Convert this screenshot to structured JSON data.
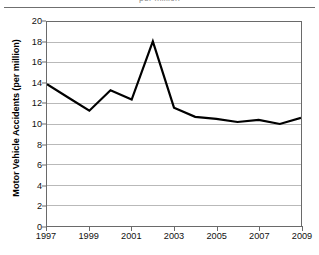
{
  "caption": {
    "clipped_text": "per million"
  },
  "chart_data": {
    "type": "line",
    "title": "",
    "xlabel": "",
    "ylabel": "Motor Vehicle Accidents (per million)",
    "x": [
      1997,
      1998,
      1999,
      2000,
      2001,
      2002,
      2003,
      2004,
      2005,
      2006,
      2007,
      2008,
      2009
    ],
    "values": [
      13.9,
      12.6,
      11.3,
      13.3,
      12.4,
      18.1,
      11.6,
      10.7,
      10.5,
      10.2,
      10.4,
      10.0,
      10.6
    ],
    "series": [
      {
        "name": "Motor Vehicle Accidents",
        "values": [
          13.9,
          12.6,
          11.3,
          13.3,
          12.4,
          18.1,
          11.6,
          10.7,
          10.5,
          10.2,
          10.4,
          10.0,
          10.6
        ]
      }
    ],
    "xlim": [
      1997,
      2009
    ],
    "ylim": [
      0,
      20
    ],
    "y_ticks": [
      0,
      2,
      4,
      6,
      8,
      10,
      12,
      14,
      16,
      18,
      20
    ],
    "y_tick_labels": [
      "0",
      "2",
      "4",
      "6",
      "8",
      "10",
      "12",
      "14",
      "16",
      "18",
      "20"
    ],
    "x_ticks": [
      1997,
      1999,
      2001,
      2003,
      2005,
      2007,
      2009
    ],
    "x_tick_labels": [
      "1997",
      "1999",
      "2001",
      "2003",
      "2005",
      "2007",
      "2009"
    ],
    "grid": "horizontal",
    "legend": "none",
    "line_color": "#000000",
    "grid_color": "#b8b8b8",
    "axis_color": "#6a6a6a",
    "background_color": "#ffffff"
  }
}
